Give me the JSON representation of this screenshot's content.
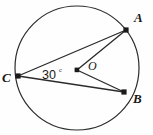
{
  "figure": {
    "background_color": "#fefefe",
    "stroke_color": "#2b2b2b",
    "label_color": "#171717"
  },
  "circle": {
    "name": "circle-outline",
    "center_x": 77,
    "center_y": 68,
    "radius": 62,
    "stroke_width": 1.2,
    "fill": "none"
  },
  "points": [
    {
      "id": "A",
      "label": "A",
      "x": 126,
      "y": 30,
      "label_x": 134,
      "label_y": 22,
      "marker": true
    },
    {
      "id": "B",
      "label": "B",
      "x": 124,
      "y": 92,
      "label_x": 133,
      "label_y": 103,
      "marker": true
    },
    {
      "id": "C",
      "label": "C",
      "x": 18,
      "y": 76,
      "label_x": 3,
      "label_y": 81,
      "marker": true
    },
    {
      "id": "O",
      "label": "O",
      "x": 77,
      "y": 70,
      "label_x": 89,
      "label_y": 70,
      "marker": true
    }
  ],
  "segments": [
    {
      "name": "chord-CA",
      "from": "C",
      "to": "A",
      "x1": 18,
      "y1": 76,
      "x2": 126,
      "y2": 30
    },
    {
      "name": "chord-CB",
      "from": "C",
      "to": "B",
      "x1": 18,
      "y1": 76,
      "x2": 124,
      "y2": 92
    },
    {
      "name": "radius-OA",
      "from": "O",
      "to": "A",
      "x1": 77,
      "y1": 70,
      "x2": 126,
      "y2": 30
    },
    {
      "name": "radius-OB",
      "from": "O",
      "to": "B",
      "x1": 77,
      "y1": 70,
      "x2": 124,
      "y2": 92
    }
  ],
  "angle": {
    "name": "inscribed-angle-at-C",
    "value": "30",
    "unit": "c",
    "vertex": "C",
    "text_x": 42,
    "text_y": 78,
    "unit_x": 60,
    "unit_y": 72
  }
}
